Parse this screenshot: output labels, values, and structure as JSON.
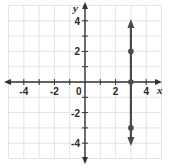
{
  "chart_data": {
    "type": "line",
    "title": "",
    "xlabel": "x",
    "ylabel": "y",
    "xlim": [
      -5,
      5
    ],
    "ylim": [
      -5,
      5
    ],
    "grid": true,
    "x_tick_labels": [
      "-4",
      "-2",
      "0",
      "2",
      "4"
    ],
    "y_tick_labels": [
      "4",
      "2",
      "-2",
      "-4"
    ],
    "series": [
      {
        "name": "x = 3",
        "kind": "vertical-line-with-arrows",
        "x": 3,
        "points": [
          {
            "x": 3,
            "y": 2
          },
          {
            "x": 3,
            "y": 0
          },
          {
            "x": 3,
            "y": -3
          }
        ]
      }
    ]
  },
  "colors": {
    "grid": "#dcdcdc",
    "axis": "#333333",
    "line": "#4a4a4a"
  }
}
